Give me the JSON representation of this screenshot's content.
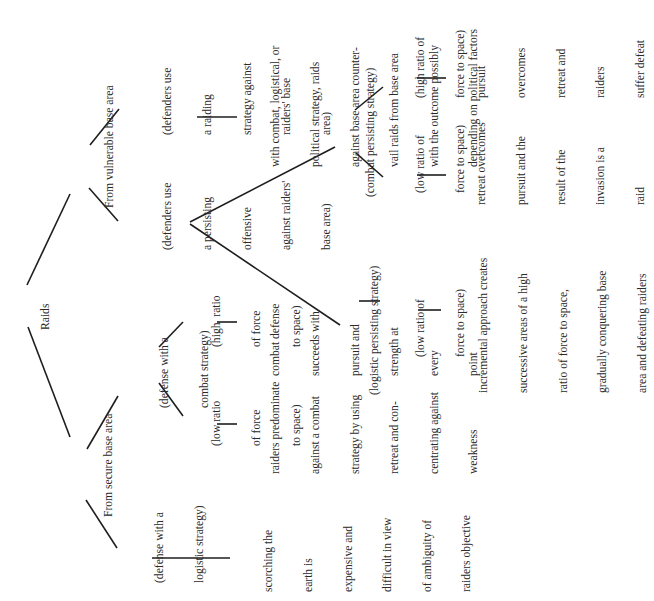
{
  "diagram": {
    "title": "Raids",
    "branches": {
      "vulnerable": {
        "label": "From vulnerable base area"
      },
      "secure": {
        "label": "From secure base area"
      }
    },
    "nodes": {
      "raiding_strategy": {
        "lines": [
          "(defenders use",
          "a raiding",
          "strategy against",
          "raiders' base",
          "area)"
        ]
      },
      "raiding_outcome": {
        "lines": [
          "with combat, logistical, or",
          "political strategy, raids",
          "against base area counter-",
          "vail raids from base area",
          "with the outcome possibly",
          "depending on political factors"
        ]
      },
      "persisting_offensive": {
        "lines": [
          "(defenders use",
          "a persisting",
          "offensive",
          "against raiders'",
          "base area)"
        ]
      },
      "combat_persisting": {
        "label": "(combat persisting strategy)"
      },
      "cp_low": {
        "lines": [
          "(low ratio of",
          "force to space)"
        ]
      },
      "cp_low_outcome": {
        "lines": [
          "retreat overcomes",
          "pursuit and the",
          "result of the",
          "invasion is a",
          "raid"
        ]
      },
      "cp_high": {
        "lines": [
          "(high ratio of",
          "force to space)"
        ]
      },
      "cp_high_outcome": {
        "lines": [
          "pursuit",
          "overcomes",
          "retreat and",
          "raiders",
          "suffer defeat"
        ]
      },
      "logistic_persisting": {
        "label": "(logistic persisting strategy)"
      },
      "lp_low": {
        "lines": [
          "(low ratio of",
          "force to space)"
        ]
      },
      "lp_low_outcome": {
        "lines": [
          "incremental approach creates",
          "successive areas of a high",
          "ratio of force to space,",
          "gradually conquering base",
          "area and defeating raiders"
        ]
      },
      "combat_strategy": {
        "lines": [
          "(defense with a",
          "combat strategy)"
        ]
      },
      "cs_low": {
        "lines": [
          "(low ratio",
          "of force",
          "to space)"
        ]
      },
      "cs_low_outcome": {
        "lines": [
          "raiders predominate",
          "against a combat",
          "strategy by using",
          "retreat and con-",
          "centrating against",
          "weakness"
        ]
      },
      "cs_high": {
        "lines": [
          "(high  ratio",
          "of force",
          "to space)"
        ]
      },
      "cs_high_outcome": {
        "lines": [
          "combat defense",
          "succeeds with",
          "pursuit and",
          "strength at",
          "every",
          "point"
        ]
      },
      "logistic_strategy": {
        "lines": [
          "(defense with a",
          "logistic strategy)"
        ]
      },
      "ls_outcome": {
        "lines": [
          "scorching the",
          "earth is",
          "expensive and",
          "difficult in view",
          "of ambiguity of",
          "raiders objective"
        ]
      }
    },
    "colors": {
      "ink": "#1e1e1e",
      "text": "#2a2a2a",
      "background": "#ffffff"
    }
  }
}
